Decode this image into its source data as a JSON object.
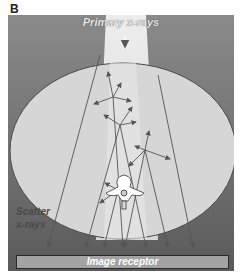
{
  "panel": {
    "label": "B"
  },
  "labels": {
    "primary": "Primary x-rays",
    "scatter_line1": "Scatter",
    "scatter_line2": "x-rays",
    "receptor": "Image receptor"
  },
  "colors": {
    "background": "#7a7a7a",
    "beam": "#e6e6e6",
    "patient": "#d4d4d4",
    "receptor": "#a3a3a3",
    "arrows": "#555555"
  }
}
